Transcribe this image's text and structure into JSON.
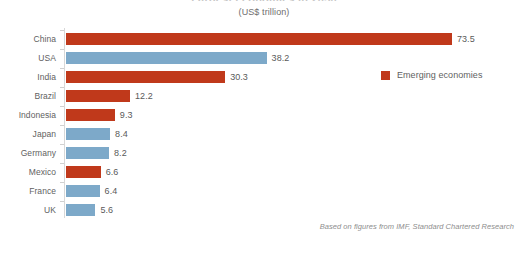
{
  "chart_data": {
    "type": "bar",
    "orientation": "horizontal",
    "title": "Largest economies in 2030",
    "subtitle": "(US$ trillion)",
    "xlabel": "",
    "ylabel": "",
    "xlim": [
      0,
      73.5
    ],
    "grid": false,
    "categories": [
      "China",
      "USA",
      "India",
      "Brazil",
      "Indonesia",
      "Japan",
      "Germany",
      "Mexico",
      "France",
      "UK"
    ],
    "values": [
      73.5,
      38.2,
      30.3,
      12.2,
      9.3,
      8.4,
      8.2,
      6.6,
      6.4,
      5.6
    ],
    "value_labels": [
      "73.5",
      "38.2",
      "30.3",
      "12.2",
      "9.3",
      "8.4",
      "8.2",
      "6.6",
      "6.4",
      "5.6"
    ],
    "groups": [
      "emerging",
      "developed",
      "emerging",
      "emerging",
      "emerging",
      "developed",
      "developed",
      "emerging",
      "developed",
      "developed"
    ],
    "colors": {
      "emerging": "#c0391b",
      "developed": "#7da9c9",
      "label_text": "#5f5f5f",
      "value_text": "#5a5a5a",
      "axis": "#d8d8d8",
      "background": "#ffffff"
    },
    "legend": {
      "position": "right-upper",
      "entries": [
        {
          "label": "Emerging economies",
          "color": "#c0391b",
          "key": "emerging"
        }
      ]
    },
    "annotations": [
      {
        "name": "source-note",
        "text": "Based on figures from IMF, Standard Chartered Research"
      }
    ]
  },
  "footnote": "Based on figures from IMF, Standard Chartered Research"
}
